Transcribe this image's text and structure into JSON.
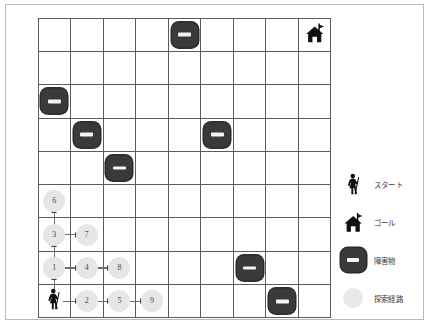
{
  "figure": {
    "type": "grid-maze-search-visualization",
    "grid": {
      "columns": 9,
      "rows": 9
    }
  },
  "legend": {
    "items": [
      {
        "icon": "hiker-person-icon",
        "label": "スタート"
      },
      {
        "icon": "house-flag-icon",
        "label": "ゴール"
      },
      {
        "icon": "obstacle-block-icon",
        "label": "障害物"
      },
      {
        "icon": "path-dot-icon",
        "label": "探索経路"
      }
    ]
  },
  "grid_contents": {
    "start": {
      "row": 8,
      "col": 0,
      "icon": "hiker-person-icon"
    },
    "goal": {
      "row": 0,
      "col": 8,
      "icon": "house-flag-icon"
    },
    "obstacles": [
      {
        "row": 0,
        "col": 4
      },
      {
        "row": 2,
        "col": 0
      },
      {
        "row": 3,
        "col": 1
      },
      {
        "row": 3,
        "col": 5
      },
      {
        "row": 4,
        "col": 2
      },
      {
        "row": 7,
        "col": 6
      },
      {
        "row": 8,
        "col": 7
      }
    ],
    "search_path_nodes": [
      {
        "row": 7,
        "col": 0,
        "label": "1"
      },
      {
        "row": 8,
        "col": 1,
        "label": "2"
      },
      {
        "row": 6,
        "col": 0,
        "label": "3"
      },
      {
        "row": 7,
        "col": 1,
        "label": "4"
      },
      {
        "row": 8,
        "col": 2,
        "label": "5"
      },
      {
        "row": 5,
        "col": 0,
        "label": "6"
      },
      {
        "row": 6,
        "col": 1,
        "label": "7"
      },
      {
        "row": 7,
        "col": 2,
        "label": "8"
      },
      {
        "row": 8,
        "col": 3,
        "label": "9"
      }
    ],
    "arrows": [
      {
        "from": "start",
        "to": "1",
        "direction": "up"
      },
      {
        "from": "1",
        "to": "3",
        "direction": "up"
      },
      {
        "from": "3",
        "to": "6",
        "direction": "up"
      },
      {
        "from": "start",
        "to": "2",
        "direction": "right"
      },
      {
        "from": "2",
        "to": "5",
        "direction": "right"
      },
      {
        "from": "5",
        "to": "9",
        "direction": "right"
      },
      {
        "from": "1",
        "to": "4",
        "direction": "right"
      },
      {
        "from": "4",
        "to": "8",
        "direction": "right"
      },
      {
        "from": "3",
        "to": "7",
        "direction": "right"
      }
    ]
  },
  "colors": {
    "obstacle": "#3a3a3a",
    "obstacle_bar": "#f4f4f4",
    "path_node": "#e6e6e6",
    "grid_line": "#5b5b5b",
    "frame": "#b9b9b9",
    "arrow": "#6d6d6d",
    "icon": "#1a1a1a"
  }
}
